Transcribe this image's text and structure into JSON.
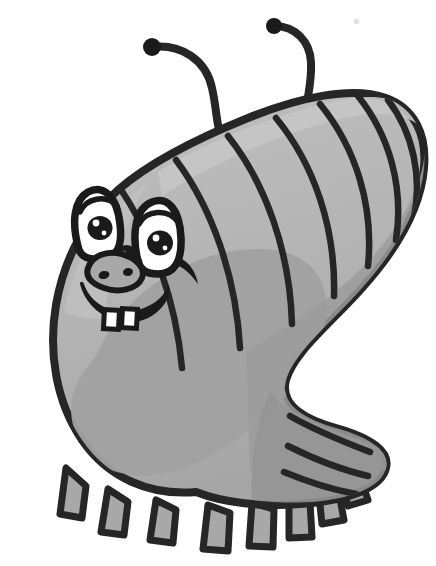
{
  "illustration": {
    "title": "Cartoon caterpillar grub",
    "subject": "caterpillar",
    "style": "grayscale cartoon clip art",
    "background_color": "#ffffff",
    "canvas": {
      "width": 436,
      "height": 566
    },
    "palette": {
      "outline": "#262626",
      "body_light": "#b5b5b5",
      "body_mid": "#a8a8a8",
      "body_shadow": "#9a9a9a",
      "body_deep_shadow": "#8f8f8f",
      "highlight": "#c3c3c3",
      "eye_white": "#ffffff",
      "pupil": "#1a1a1a",
      "tooth_white": "#ffffff",
      "speck": "#e2e2e2"
    },
    "parts": {
      "body_label": "segmented-body",
      "head_label": "head",
      "antenna_left_label": "left-antenna",
      "antenna_right_label": "right-antenna",
      "eye_left_label": "left-eye",
      "eye_right_label": "right-eye",
      "nose_label": "nose",
      "mouth_label": "smiling-mouth",
      "teeth_label": "two-front-teeth",
      "legs_label": "legs"
    },
    "counts": {
      "antennae": 2,
      "eyes": 2,
      "teeth": 2,
      "body_segment_lines": 11,
      "legs": 9
    },
    "marks": {
      "speck_x": 354,
      "speck_y": 19
    },
    "caption": "Cartoon caterpillar grub"
  }
}
